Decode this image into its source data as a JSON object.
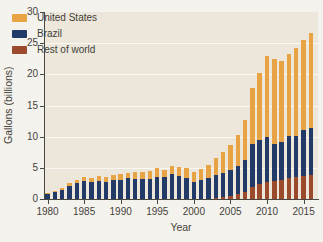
{
  "style": {
    "background": "#f4f2ec",
    "plot_background": "#ece7da",
    "axis_color": "#4a4842",
    "gridline_color": "#faf8f2",
    "text_color": "#45433d"
  },
  "chart_data": {
    "type": "bar",
    "stacked": true,
    "xlabel": "Year",
    "ylabel": "Gallons (billions)",
    "ylim": [
      0,
      30
    ],
    "yticks": [
      0,
      5,
      10,
      15,
      20,
      25,
      30
    ],
    "xticks": [
      1980,
      1985,
      1990,
      1995,
      2000,
      2005,
      2010,
      2015
    ],
    "grid": true,
    "legend_position": "top-left",
    "stack_bottom_to_top": [
      "Rest of world",
      "Brazil",
      "United States"
    ],
    "categories": [
      1980,
      1981,
      1982,
      1983,
      1984,
      1985,
      1986,
      1987,
      1988,
      1989,
      1990,
      1991,
      1992,
      1993,
      1994,
      1995,
      1996,
      1997,
      1998,
      1999,
      2000,
      2001,
      2002,
      2003,
      2004,
      2005,
      2006,
      2007,
      2008,
      2009,
      2010,
      2011,
      2012,
      2013,
      2014,
      2015,
      2016
    ],
    "series": [
      {
        "name": "United States",
        "color": "#e7a344",
        "values": [
          0.1,
          0.15,
          0.2,
          0.4,
          0.45,
          0.6,
          0.7,
          0.8,
          0.85,
          0.85,
          0.9,
          0.95,
          1.1,
          1.2,
          1.35,
          1.4,
          1.0,
          1.3,
          1.4,
          1.5,
          1.6,
          1.8,
          2.1,
          2.8,
          3.4,
          3.9,
          4.9,
          6.5,
          9.0,
          10.8,
          13.0,
          13.5,
          13.0,
          13.2,
          14.2,
          14.5,
          15.2
        ]
      },
      {
        "name": "Brazil",
        "color": "#223a67",
        "values": [
          0.9,
          1.1,
          1.5,
          2.1,
          2.6,
          2.9,
          2.7,
          2.9,
          2.7,
          3.0,
          3.1,
          3.3,
          3.2,
          3.2,
          3.2,
          3.5,
          3.6,
          4.0,
          3.7,
          3.4,
          2.8,
          3.0,
          3.3,
          3.7,
          3.9,
          4.2,
          4.5,
          5.0,
          6.8,
          7.0,
          7.2,
          6.0,
          6.2,
          6.8,
          6.6,
          7.3,
          7.5
        ]
      },
      {
        "name": "Rest of world",
        "color": "#9c4a2c",
        "values": [
          0,
          0,
          0,
          0,
          0,
          0,
          0,
          0,
          0,
          0,
          0,
          0,
          0,
          0,
          0,
          0,
          0,
          0,
          0,
          0,
          0,
          0,
          0,
          0.1,
          0.3,
          0.5,
          0.8,
          1.2,
          2.0,
          2.4,
          2.7,
          2.9,
          3.0,
          3.3,
          3.5,
          3.7,
          3.9
        ]
      }
    ]
  }
}
